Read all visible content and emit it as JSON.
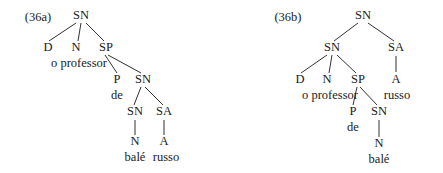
{
  "figure": {
    "width": 443,
    "height": 173,
    "background": "#ffffff",
    "ink_color": "#1a1a1a"
  },
  "trees": [
    {
      "id": "36a",
      "example_label": {
        "text": "(36a)",
        "x": 38,
        "y": 18
      },
      "nodes": [
        {
          "name": "root-sn",
          "text": "SN",
          "x": 81,
          "y": 16,
          "kind": "category"
        },
        {
          "name": "det-d",
          "text": "D",
          "x": 48,
          "y": 48,
          "kind": "category"
        },
        {
          "name": "noun-n",
          "text": "N",
          "x": 76,
          "y": 48,
          "kind": "category"
        },
        {
          "name": "prep-phrase-sp",
          "text": "SP",
          "x": 106,
          "y": 48,
          "kind": "category"
        },
        {
          "name": "word-o-professor",
          "text": "o professor",
          "x": 79,
          "y": 64,
          "kind": "terminal"
        },
        {
          "name": "prep-p",
          "text": "P",
          "x": 117,
          "y": 80,
          "kind": "category"
        },
        {
          "name": "inner-sn",
          "text": "SN",
          "x": 143,
          "y": 80,
          "kind": "category"
        },
        {
          "name": "word-de",
          "text": "de",
          "x": 117,
          "y": 96,
          "kind": "terminal"
        },
        {
          "name": "lower-sn",
          "text": "SN",
          "x": 135,
          "y": 112,
          "kind": "category"
        },
        {
          "name": "adj-phrase-sa",
          "text": "SA",
          "x": 164,
          "y": 112,
          "kind": "category"
        },
        {
          "name": "lower-noun-n",
          "text": "N",
          "x": 135,
          "y": 142,
          "kind": "category"
        },
        {
          "name": "adj-a",
          "text": "A",
          "x": 164,
          "y": 142,
          "kind": "category"
        },
        {
          "name": "word-bale",
          "text": "balé",
          "x": 135,
          "y": 158,
          "kind": "terminal"
        },
        {
          "name": "word-russo",
          "text": "russo",
          "x": 166,
          "y": 158,
          "kind": "terminal"
        }
      ],
      "edges": [
        {
          "name": "edge-root-to-d",
          "x1": 76,
          "y1": 23,
          "x2": 49,
          "y2": 41
        },
        {
          "name": "edge-root-to-n",
          "x1": 81,
          "y1": 23,
          "x2": 78,
          "y2": 41
        },
        {
          "name": "edge-root-to-sp",
          "x1": 86,
          "y1": 23,
          "x2": 104,
          "y2": 41
        },
        {
          "name": "edge-sp-to-p",
          "x1": 105,
          "y1": 55,
          "x2": 117,
          "y2": 73
        },
        {
          "name": "edge-sp-to-sn",
          "x1": 108,
          "y1": 55,
          "x2": 141,
          "y2": 73
        },
        {
          "name": "edge-sn-to-lower-sn",
          "x1": 141,
          "y1": 87,
          "x2": 134,
          "y2": 105
        },
        {
          "name": "edge-sn-to-sa",
          "x1": 145,
          "y1": 87,
          "x2": 163,
          "y2": 105
        },
        {
          "name": "edge-lower-sn-to-n",
          "x1": 135,
          "y1": 120,
          "x2": 135,
          "y2": 135
        },
        {
          "name": "edge-sa-to-a",
          "x1": 164,
          "y1": 120,
          "x2": 164,
          "y2": 135
        }
      ]
    },
    {
      "id": "36b",
      "example_label": {
        "text": "(36b)",
        "x": 288,
        "y": 18
      },
      "nodes": [
        {
          "name": "root-sn",
          "text": "SN",
          "x": 363,
          "y": 16,
          "kind": "category"
        },
        {
          "name": "upper-sn",
          "text": "SN",
          "x": 332,
          "y": 48,
          "kind": "category"
        },
        {
          "name": "adj-phrase-sa",
          "text": "SA",
          "x": 396,
          "y": 48,
          "kind": "category"
        },
        {
          "name": "det-d",
          "text": "D",
          "x": 300,
          "y": 80,
          "kind": "category"
        },
        {
          "name": "noun-n",
          "text": "N",
          "x": 327,
          "y": 80,
          "kind": "category"
        },
        {
          "name": "prep-phrase-sp",
          "text": "SP",
          "x": 358,
          "y": 80,
          "kind": "category"
        },
        {
          "name": "adj-a",
          "text": "A",
          "x": 396,
          "y": 80,
          "kind": "category"
        },
        {
          "name": "word-o-professor",
          "text": "o professor",
          "x": 330,
          "y": 96,
          "kind": "terminal"
        },
        {
          "name": "word-russo",
          "text": "russo",
          "x": 397,
          "y": 96,
          "kind": "terminal"
        },
        {
          "name": "prep-p",
          "text": "P",
          "x": 353,
          "y": 112,
          "kind": "category"
        },
        {
          "name": "inner-sn",
          "text": "SN",
          "x": 379,
          "y": 112,
          "kind": "category"
        },
        {
          "name": "word-de",
          "text": "de",
          "x": 353,
          "y": 128,
          "kind": "terminal"
        },
        {
          "name": "lower-noun-n",
          "text": "N",
          "x": 379,
          "y": 144,
          "kind": "category"
        },
        {
          "name": "word-bale",
          "text": "balé",
          "x": 379,
          "y": 160,
          "kind": "terminal"
        }
      ],
      "edges": [
        {
          "name": "edge-root-to-sn",
          "x1": 358,
          "y1": 23,
          "x2": 334,
          "y2": 41
        },
        {
          "name": "edge-root-to-sa",
          "x1": 368,
          "y1": 23,
          "x2": 394,
          "y2": 41
        },
        {
          "name": "edge-sn-to-d",
          "x1": 327,
          "y1": 55,
          "x2": 301,
          "y2": 73
        },
        {
          "name": "edge-sn-to-n",
          "x1": 332,
          "y1": 55,
          "x2": 329,
          "y2": 73
        },
        {
          "name": "edge-sn-to-sp",
          "x1": 337,
          "y1": 55,
          "x2": 356,
          "y2": 73
        },
        {
          "name": "edge-sa-to-a",
          "x1": 396,
          "y1": 56,
          "x2": 396,
          "y2": 72
        },
        {
          "name": "edge-sp-to-p",
          "x1": 357,
          "y1": 87,
          "x2": 353,
          "y2": 105
        },
        {
          "name": "edge-sp-to-sn",
          "x1": 360,
          "y1": 87,
          "x2": 377,
          "y2": 105
        },
        {
          "name": "edge-sn-to-n-lower",
          "x1": 379,
          "y1": 120,
          "x2": 379,
          "y2": 137
        }
      ]
    }
  ]
}
